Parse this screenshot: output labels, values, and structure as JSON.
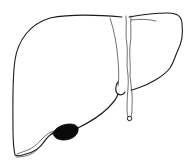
{
  "illustration": {
    "subject": "liver",
    "style": "black line drawing on white",
    "parts": [
      {
        "name": "right-lobe (viewer left, large)"
      },
      {
        "name": "left-lobe (viewer right, smaller)"
      },
      {
        "name": "falciform-ligament"
      },
      {
        "name": "round-ligament-tail"
      },
      {
        "name": "gallbladder (filled black)"
      }
    ],
    "colors": {
      "background": "#ffffff",
      "stroke": "#1a1a1a",
      "gallbladder": "#0a0a0a"
    }
  }
}
